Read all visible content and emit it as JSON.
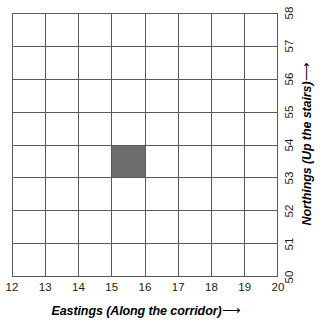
{
  "chart_data": {
    "type": "heatmap",
    "title": "",
    "xlabel": "Eastings (Along the corridor)",
    "ylabel": "Northings (Up the stairs)",
    "xlabel_arrow": "⟶",
    "ylabel_arrow": "⟶",
    "grid": true,
    "xlim": [
      12,
      20
    ],
    "ylim": [
      50,
      58
    ],
    "x_ticks": [
      "12",
      "13",
      "14",
      "15",
      "16",
      "17",
      "18",
      "19",
      "20"
    ],
    "y_ticks": [
      "50",
      "51",
      "52",
      "53",
      "54",
      "55",
      "56",
      "57",
      "58"
    ],
    "columns": 8,
    "rows": 8,
    "cell_colors": {
      "empty": "#ffffff",
      "filled": "#6e6e6e",
      "gridline": "#5b5b5b"
    },
    "filled_cells": [
      {
        "easting_from": 15,
        "easting_to": 16,
        "northing_from": 54,
        "northing_to": 55,
        "grid_reference": "1554",
        "color": "#6e6e6e"
      }
    ],
    "values": [
      [
        0,
        0,
        0,
        0,
        0,
        0,
        0,
        0
      ],
      [
        0,
        0,
        0,
        0,
        0,
        0,
        0,
        0
      ],
      [
        0,
        0,
        0,
        0,
        0,
        0,
        0,
        0
      ],
      [
        0,
        0,
        0,
        1,
        0,
        0,
        0,
        0
      ],
      [
        0,
        0,
        0,
        0,
        0,
        0,
        0,
        0
      ],
      [
        0,
        0,
        0,
        0,
        0,
        0,
        0,
        0
      ],
      [
        0,
        0,
        0,
        0,
        0,
        0,
        0,
        0
      ],
      [
        0,
        0,
        0,
        0,
        0,
        0,
        0,
        0
      ]
    ]
  }
}
